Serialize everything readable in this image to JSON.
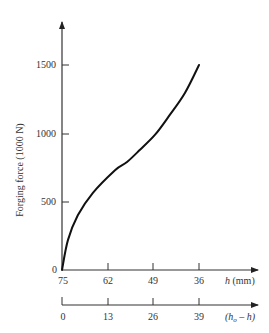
{
  "chart_data": {
    "type": "line",
    "title": "",
    "ylabel": "Forging force (1000 N)",
    "xlabel": "h (mm)",
    "xlabel_secondary": "(h_o - h)",
    "ylim": [
      0,
      1700
    ],
    "y_ticks": [
      0,
      500,
      1000,
      1500
    ],
    "x_ticks": [
      75,
      62,
      49,
      36
    ],
    "x_secondary_ticks": [
      0,
      13,
      26,
      39
    ],
    "grid": false,
    "legend": null,
    "series": [
      {
        "name": "Forging force",
        "x": [
          75,
          73.3,
          70.5,
          66.2,
          59.9,
          56.5,
          52.8,
          48.5,
          44.3,
          40.0,
          36
        ],
        "values": [
          0,
          220,
          400,
          565,
          730,
          790,
          880,
          990,
          1135,
          1295,
          1500
        ]
      }
    ]
  },
  "labels": {
    "y_axis_title": "Forging force (1000 N)",
    "y_ticks": [
      "0",
      "500",
      "1000",
      "1500"
    ],
    "x_ticks": [
      "75",
      "62",
      "49",
      "36"
    ],
    "x_axis_title_var": "h",
    "x_axis_title_unit": " (mm)",
    "x2_ticks": [
      "0",
      "13",
      "26",
      "39"
    ],
    "x2_axis_title": "(h",
    "x2_axis_sub": "o",
    "x2_axis_tail": " – h)"
  }
}
